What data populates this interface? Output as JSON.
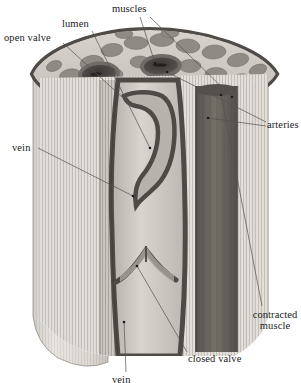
{
  "figure": {
    "style": "grayscale halftone anatomical illustration",
    "colors": {
      "background": "#ffffff",
      "label_text": "#1a1a1a",
      "leader_line": "#4a4a4a",
      "skin_light": "#dedbd6",
      "skin_shadow": "#b9b5ae",
      "cut_rim_dark": "#55514c",
      "muscle_matrix": "#cfcbc4",
      "muscle_bundle": "#8e8a84",
      "muscle_bundle_dark": "#716d68",
      "artery_lumen": "#4a4744",
      "artery_wall": "#6f6b66",
      "vein_lumen": "#c9c6c0",
      "vein_wall": "#4e4a46",
      "contracted_muscle": "#6a6661",
      "striation": "#9a968f"
    }
  },
  "labels": [
    {
      "id": "open-valve",
      "text": "open valve",
      "x": 4,
      "y": 32
    },
    {
      "id": "lumen",
      "text": "lumen",
      "x": 62,
      "y": 18
    },
    {
      "id": "muscles",
      "text": "muscles",
      "x": 112,
      "y": 3
    },
    {
      "id": "arteries",
      "text": "arteries",
      "x": 267,
      "y": 119
    },
    {
      "id": "vein-left",
      "text": "vein",
      "x": 12,
      "y": 142
    },
    {
      "id": "contracted",
      "text": "contracted muscle",
      "x": 249,
      "y": 310
    },
    {
      "id": "closed-valve",
      "text": "closed valve",
      "x": 188,
      "y": 353
    },
    {
      "id": "vein-bottom",
      "text": "vein",
      "x": 112,
      "y": 374
    }
  ],
  "leaders": [
    {
      "for": "open-valve",
      "from": [
        63,
        43
      ],
      "to": [
        122,
        97
      ],
      "dot": false
    },
    {
      "for": "lumen",
      "from": [
        92,
        31
      ],
      "to": [
        150,
        148
      ],
      "dot": true
    },
    {
      "for": "muscles",
      "from": [
        140,
        17
      ],
      "to": [
        155,
        63
      ],
      "dot": true
    },
    {
      "for": "muscles",
      "from": [
        150,
        17
      ],
      "to": [
        232,
        97
      ],
      "dot": true
    },
    {
      "for": "arteries",
      "from": [
        266,
        122
      ],
      "to": [
        167,
        72
      ],
      "dot": true
    },
    {
      "for": "arteries",
      "from": [
        266,
        126
      ],
      "to": [
        208,
        118
      ],
      "dot": true
    },
    {
      "for": "vein-left",
      "from": [
        38,
        148
      ],
      "to": [
        133,
        196
      ],
      "dot": true
    },
    {
      "for": "contracted",
      "from": [
        262,
        306
      ],
      "to": [
        221,
        95
      ],
      "dot": true
    },
    {
      "for": "closed-valve",
      "from": [
        187,
        352
      ],
      "to": [
        137,
        266
      ],
      "dot": true
    },
    {
      "for": "vein-bottom",
      "from": [
        126,
        372
      ],
      "to": [
        124,
        322
      ],
      "dot": true
    }
  ],
  "structures": [
    {
      "name": "skin-and-fascia",
      "description": "outer light striated sleeve of the limb"
    },
    {
      "name": "cut-rim",
      "description": "dark band along the cut edge of the sleeve"
    },
    {
      "name": "muscle-cross-section",
      "description": "top face with polygonal muscle bundles in pale matrix"
    },
    {
      "name": "artery-opening-left",
      "description": "dark oval artery lumen on the cut face"
    },
    {
      "name": "artery-opening-right",
      "description": "second dark oval artery lumen on the cut face"
    },
    {
      "name": "vein-channel",
      "description": "central pale vein with dark wall running top to bottom"
    },
    {
      "name": "open-valve-flap",
      "description": "upper valve cusp lying open against the vein wall"
    },
    {
      "name": "closed-valve-flap",
      "description": "lower valve cusps meeting to close the vein"
    },
    {
      "name": "contracted-muscle-column",
      "description": "dark vertical muscle cylinder right of the vein"
    },
    {
      "name": "artery-column",
      "description": "pale striated vertical vessel at the right"
    }
  ]
}
